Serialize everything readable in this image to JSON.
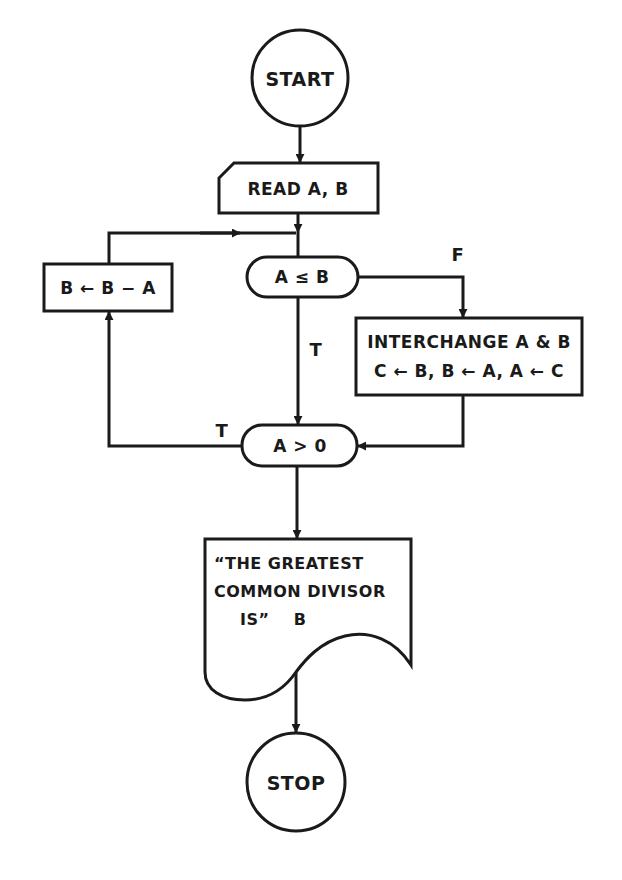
{
  "diagram": {
    "type": "flowchart",
    "stroke_color": "#1a1a1a",
    "background": "#ffffff",
    "nodes": {
      "start": {
        "shape": "circle",
        "label": "START"
      },
      "read": {
        "shape": "input",
        "label": "READ A, B"
      },
      "cond1": {
        "shape": "terminal-pill",
        "label": "A ≤ B"
      },
      "subtract": {
        "shape": "process",
        "label": "B ← B − A"
      },
      "interchange": {
        "shape": "process",
        "line1": "INTERCHANGE A & B",
        "line2": "C ← B, B ← A, A ← C"
      },
      "cond2": {
        "shape": "terminal-pill",
        "label": "A > 0"
      },
      "output": {
        "shape": "document",
        "line1": "“THE GREATEST",
        "line2": "COMMON DIVISOR",
        "line3": "IS”    B"
      },
      "stop": {
        "shape": "circle",
        "label": "STOP"
      }
    },
    "edges": {
      "cond1_true": "T",
      "cond1_false": "F",
      "cond2_true": "T"
    },
    "connections": [
      {
        "from": "start",
        "to": "read"
      },
      {
        "from": "read",
        "to": "cond1"
      },
      {
        "from": "cond1",
        "to": "cond2",
        "label": "T"
      },
      {
        "from": "cond1",
        "to": "interchange",
        "label": "F"
      },
      {
        "from": "interchange",
        "to": "cond2"
      },
      {
        "from": "cond2",
        "to": "subtract",
        "label": "T"
      },
      {
        "from": "subtract",
        "to": "cond1"
      },
      {
        "from": "cond2",
        "to": "output"
      },
      {
        "from": "output",
        "to": "stop"
      }
    ]
  }
}
